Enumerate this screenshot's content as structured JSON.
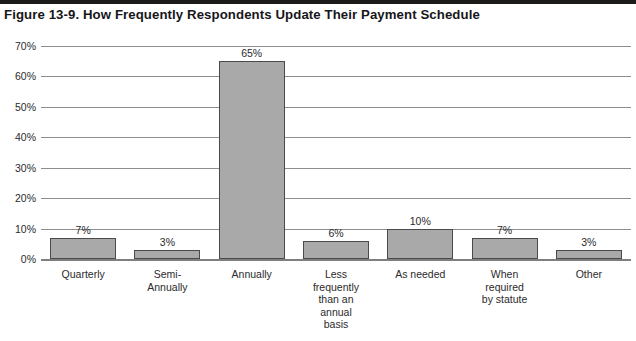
{
  "figure": {
    "title": "Figure 13-9. How Frequently Respondents Update Their Payment Schedule"
  },
  "colors": {
    "bar_fill": "#a9a9a9",
    "bar_border": "#4a4a4a",
    "gridline": "#8d8d8d",
    "text": "#2b2a2c",
    "title": "#17161a",
    "background": "#ffffff"
  },
  "chart_data": {
    "type": "bar",
    "title": "Figure 13-9. How Frequently Respondents Update Their Payment Schedule",
    "xlabel": "",
    "ylabel": "",
    "ylim": [
      0,
      70
    ],
    "ytick_labels": [
      "0%",
      "10%",
      "20%",
      "30%",
      "40%",
      "50%",
      "60%",
      "70%"
    ],
    "ytick_values": [
      0,
      10,
      20,
      30,
      40,
      50,
      60,
      70
    ],
    "grid": true,
    "legend": false,
    "categories": [
      "Quarterly",
      "Semi-\nAnnually",
      "Annually",
      "Less\nfrequently\nthan an\nannual\nbasis",
      "As needed",
      "When\nrequired\nby statute",
      "Other"
    ],
    "values": [
      7,
      3,
      65,
      6,
      10,
      7,
      3
    ],
    "data_labels": [
      "7%",
      "3%",
      "65%",
      "6%",
      "10%",
      "7%",
      "3%"
    ]
  }
}
